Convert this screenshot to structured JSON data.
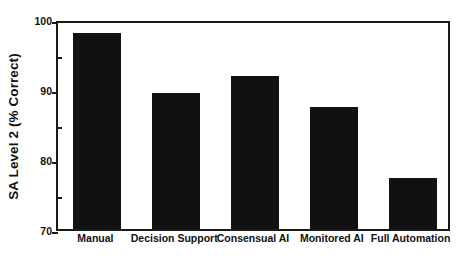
{
  "chart_data": {
    "type": "bar",
    "title": "",
    "xlabel": "",
    "ylabel": "SA Level 2 (% Correct)",
    "categories": [
      "Manual",
      "Decision Support",
      "Consensual AI",
      "Monitored AI",
      "Full Automation"
    ],
    "values": [
      98.0,
      89.5,
      91.8,
      87.5,
      77.3
    ],
    "ylim": [
      70,
      100
    ],
    "ytick_labels": [
      "100",
      "90",
      "80",
      "70"
    ],
    "ytick_values": [
      100,
      90,
      80,
      70
    ],
    "yminor_ticks": [
      95,
      85,
      75
    ],
    "grid": false,
    "legend": null,
    "bar_color": "#111111",
    "axis_color": "#1a1a1a",
    "background": "#ffffff"
  }
}
